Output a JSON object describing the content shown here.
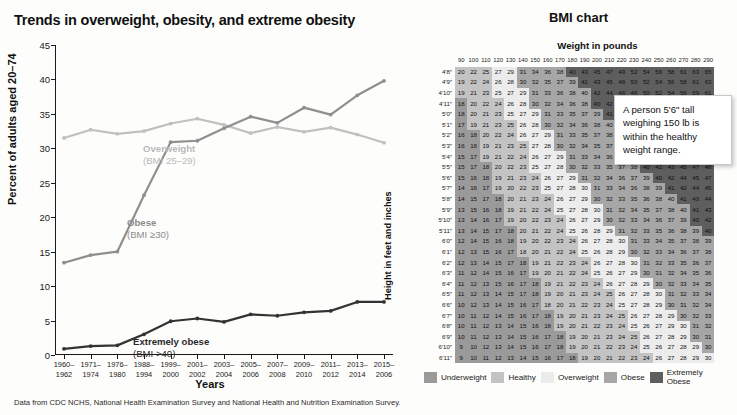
{
  "left": {
    "title": "Trends in overweight, obesity, and extreme obesity",
    "ylabel": "Percent of adults aged 20–74",
    "xlabel": "Years",
    "footnote": "Data from CDC NCHS, National Health Examination Survey and National Health and Nutrition Examination Survey.",
    "labels": {
      "overweight_name": "Overweight",
      "overweight_sub": "(BMI 25–29)",
      "obese_name": "Obese",
      "obese_sub": "(BMI ≥30)",
      "extreme_name": "Extremely obese",
      "extreme_sub": "(BMI >40)"
    }
  },
  "chart_data": {
    "type": "line",
    "title": "Trends in overweight, obesity, and extreme obesity",
    "xlabel": "Years",
    "ylabel": "Percent of adults aged 20–74",
    "ylim": [
      0,
      45
    ],
    "yticks": [
      0,
      5,
      10,
      15,
      20,
      25,
      30,
      35,
      40,
      45
    ],
    "grid": false,
    "legend_position": "inline-labels",
    "categories": [
      "1960–\n1962",
      "1971–\n1974",
      "1976–\n1980",
      "1988–\n1994",
      "1999–\n2000",
      "2001–\n2002",
      "2003–\n2004",
      "2005–\n2006",
      "2007–\n2008",
      "2009–\n2010",
      "2011–\n2012",
      "2013–\n2014",
      "2015–\n2006"
    ],
    "series": [
      {
        "name": "Overweight (BMI 25–29)",
        "color": "#c0c0c0",
        "values": [
          31.5,
          32.7,
          32.1,
          32.5,
          33.6,
          34.3,
          33.4,
          32.2,
          33.1,
          32.4,
          33.0,
          32.0,
          30.8
        ]
      },
      {
        "name": "Obese (BMI ≥30)",
        "color": "#8f8f8f",
        "values": [
          13.4,
          14.5,
          15.0,
          23.2,
          30.9,
          31.1,
          32.9,
          34.6,
          33.7,
          35.9,
          34.9,
          37.7,
          39.8
        ]
      },
      {
        "name": "Extremely obese (BMI >40)",
        "color": "#333333",
        "values": [
          0.9,
          1.3,
          1.4,
          3.0,
          4.9,
          5.3,
          4.8,
          5.9,
          5.7,
          6.2,
          6.4,
          7.7,
          7.7
        ]
      }
    ]
  },
  "right": {
    "title": "BMI chart",
    "weight_title": "Weight in pounds",
    "height_title": "Height in feet and inches",
    "callout": "A person 5'6\" tall weighing 150 lb is within the healthy weight range.",
    "weights": [
      90,
      100,
      110,
      120,
      130,
      140,
      150,
      160,
      170,
      180,
      190,
      200,
      210,
      220,
      230,
      240,
      250,
      260,
      270,
      280,
      290
    ],
    "heights": [
      "4′8″",
      "4′9″",
      "4′10″",
      "4′11″",
      "5′0″",
      "5′1″",
      "5′2″",
      "5′3″",
      "5′4″",
      "5′5″",
      "5′6″",
      "5′7″",
      "5′8″",
      "5′9″",
      "5′10″",
      "5′11″",
      "6′0″",
      "6′1″",
      "6′2″",
      "6′3″",
      "6′4″",
      "6′5″",
      "6′6″",
      "6′7″",
      "6′8″",
      "6′9″",
      "6′10″",
      "6′11″"
    ],
    "height_inches": [
      56,
      57,
      58,
      59,
      60,
      61,
      62,
      63,
      64,
      65,
      66,
      67,
      68,
      69,
      70,
      71,
      72,
      73,
      74,
      75,
      76,
      77,
      78,
      79,
      80,
      81,
      82,
      83
    ],
    "categories": [
      {
        "key": "under",
        "label": "Underweight",
        "color": "#9a9a9a",
        "max": 18.4
      },
      {
        "key": "healthy",
        "label": "Healthy",
        "color": "#c3c3c3",
        "max": 24.9
      },
      {
        "key": "over",
        "label": "Overweight",
        "color": "#ececec",
        "max": 29.9
      },
      {
        "key": "obese",
        "label": "Obese",
        "color": "#a6a6a6",
        "max": 39.9
      },
      {
        "key": "extreme",
        "label": "Extremely\nObese",
        "color": "#5e5e5e",
        "max": 999
      }
    ]
  }
}
